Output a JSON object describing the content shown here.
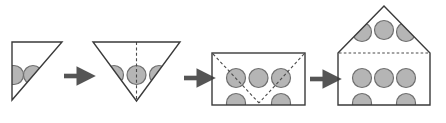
{
  "figure": {
    "type": "process-sequence-diagram",
    "title": "",
    "caption": "",
    "step_count": 4,
    "arrow_count": 3,
    "background_color": "#ffffff"
  },
  "style": {
    "outline_color": "#3a3a3a",
    "outline_width": 1.4,
    "circle_fill": "#b5b5b5",
    "circle_stroke": "#6f6f6f",
    "circle_stroke_width": 1.2,
    "circle_radius": 9.5,
    "dashed_color": "#4a4a4a",
    "dash_pattern": "3,2.4",
    "arrow_color": "#555555",
    "shape_fill": "#ffffff"
  },
  "steps": [
    {
      "index": 1,
      "name": "right-triangle-step",
      "shape": "right-triangle",
      "description": "right triangle, right angle at top-left, hypotenuse from top-right to bottom-left",
      "vertices": [
        [
          12,
          42
        ],
        [
          62,
          42
        ],
        [
          12,
          100
        ]
      ],
      "dashed_lines": [],
      "circles": [
        {
          "cx": 14,
          "cy": 75,
          "r": 9.5,
          "clipped": true
        },
        {
          "cx": 33,
          "cy": 75,
          "r": 9.5,
          "clipped": true
        }
      ],
      "circle_count": 2
    },
    {
      "index": 2,
      "name": "inverted-triangle-step",
      "shape": "inverted-triangle",
      "description": "downward pointing triangle with vertical dashed fold line through apex",
      "vertices": [
        [
          93,
          42
        ],
        [
          180,
          42
        ],
        [
          136.5,
          101
        ]
      ],
      "dashed_lines": [
        {
          "name": "vertical-fold-line",
          "x1": 136.5,
          "y1": 42,
          "x2": 136.5,
          "y2": 101
        }
      ],
      "circles": [
        {
          "cx": 114,
          "cy": 75,
          "r": 9.5,
          "clipped": true
        },
        {
          "cx": 136.5,
          "cy": 75,
          "r": 9.5,
          "clipped": false
        },
        {
          "cx": 159,
          "cy": 75,
          "r": 9.5,
          "clipped": true
        }
      ],
      "circle_count": 3
    },
    {
      "index": 3,
      "name": "rectangle-step",
      "shape": "rectangle",
      "description": "rectangle with dashed V-shaped fold lines from top corners meeting at bottom center",
      "vertices": [
        [
          212,
          53
        ],
        [
          305,
          53
        ],
        [
          305,
          105
        ],
        [
          212,
          105
        ]
      ],
      "dashed_lines": [
        {
          "name": "fold-line-left",
          "x1": 213,
          "y1": 54,
          "x2": 259,
          "y2": 103
        },
        {
          "name": "fold-line-right",
          "x1": 304,
          "y1": 54,
          "x2": 259,
          "y2": 103
        }
      ],
      "circles": [
        {
          "cx": 236,
          "cy": 78,
          "r": 9.5,
          "clipped": false
        },
        {
          "cx": 258.5,
          "cy": 78,
          "r": 9.5,
          "clipped": false
        },
        {
          "cx": 281,
          "cy": 78,
          "r": 9.5,
          "clipped": false
        },
        {
          "cx": 236,
          "cy": 103,
          "r": 9.5,
          "clipped": true
        },
        {
          "cx": 281,
          "cy": 103,
          "r": 9.5,
          "clipped": true
        }
      ],
      "circle_count": 5
    },
    {
      "index": 4,
      "name": "house-pentagon-step",
      "shape": "house-pentagon",
      "description": "pentagon house shape: triangular roof above rectangular body, dashed horizontal eave line",
      "vertices": [
        [
          338,
          53
        ],
        [
          338,
          105
        ],
        [
          430,
          105
        ],
        [
          430,
          53
        ],
        [
          384,
          6
        ]
      ],
      "dashed_lines": [
        {
          "name": "eave-line",
          "x1": 339,
          "y1": 53,
          "x2": 429,
          "y2": 53
        }
      ],
      "circles": [
        {
          "cx": 362,
          "cy": 32,
          "r": 9.5,
          "clipped": true
        },
        {
          "cx": 384,
          "cy": 30,
          "r": 9.5,
          "clipped": false
        },
        {
          "cx": 406,
          "cy": 32,
          "r": 9.5,
          "clipped": true
        },
        {
          "cx": 362,
          "cy": 78,
          "r": 9.5,
          "clipped": false
        },
        {
          "cx": 384,
          "cy": 78,
          "r": 9.5,
          "clipped": false
        },
        {
          "cx": 406,
          "cy": 78,
          "r": 9.5,
          "clipped": false
        },
        {
          "cx": 362,
          "cy": 103,
          "r": 9.5,
          "clipped": true
        },
        {
          "cx": 406,
          "cy": 103,
          "r": 9.5,
          "clipped": true
        }
      ],
      "circle_count": 8
    }
  ],
  "arrows": [
    {
      "index": 1,
      "name": "arrow-1",
      "from_step": 1,
      "to_step": 2,
      "x": 64,
      "y": 76,
      "length": 22,
      "label": ""
    },
    {
      "index": 2,
      "name": "arrow-2",
      "from_step": 2,
      "to_step": 3,
      "x": 184,
      "y": 78,
      "length": 22,
      "label": ""
    },
    {
      "index": 3,
      "name": "arrow-3",
      "from_step": 3,
      "to_step": 4,
      "x": 310,
      "y": 79,
      "length": 22,
      "label": ""
    }
  ],
  "watermark": {
    "text": "",
    "visible": false
  }
}
